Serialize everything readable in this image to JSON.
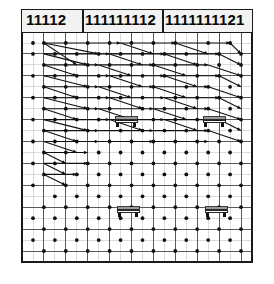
{
  "figure": {
    "background_color": "#ffffff",
    "ink_color": "#101010",
    "grid_line_color": "#b8b8b8",
    "major_grid_color": "#4a4a4a",
    "border_color": "#1a1a1a",
    "frame": {
      "x": 22,
      "y": 10,
      "width": 230,
      "height": 252
    }
  },
  "header": {
    "row_height": 22,
    "groups": [
      {
        "id": "group-1",
        "label": "11112",
        "x": 24,
        "width": 59
      },
      {
        "id": "group-2",
        "label": "111111112",
        "x": 83,
        "width": 80
      },
      {
        "id": "group-3",
        "label": "1111111121",
        "x": 163,
        "width": 89
      }
    ],
    "separator_x": [
      83,
      163
    ]
  },
  "grid": {
    "minor_step_x": 11.5,
    "minor_step_y": 11.5,
    "major_step_x": 23,
    "major_step_y": 23,
    "columns": 20,
    "rows": 20
  },
  "markers": {
    "bench_label": "bench-marker",
    "bench_count": 4,
    "benches": [
      {
        "id": "bench-1",
        "x": 126,
        "y": 120
      },
      {
        "id": "bench-2",
        "x": 214,
        "y": 120
      },
      {
        "id": "bench-3",
        "x": 128,
        "y": 210
      },
      {
        "id": "bench-4",
        "x": 216,
        "y": 210
      }
    ]
  },
  "chart_data": {
    "type": "scatter",
    "title": "11112 111111112 1111111121",
    "xlabel": "",
    "ylabel": "",
    "grid": true,
    "legend": "none",
    "xlim": [
      0,
      20
    ],
    "ylim": [
      0,
      20
    ],
    "nodes": [
      [
        1,
        1
      ],
      [
        2,
        1
      ],
      [
        4,
        1
      ],
      [
        6,
        1
      ],
      [
        8,
        1
      ],
      [
        10,
        1
      ],
      [
        12,
        1
      ],
      [
        14,
        1
      ],
      [
        17,
        1
      ],
      [
        19,
        1
      ],
      [
        1,
        2
      ],
      [
        3,
        2
      ],
      [
        5,
        2
      ],
      [
        7,
        2
      ],
      [
        9,
        2
      ],
      [
        11,
        2
      ],
      [
        13,
        2
      ],
      [
        15,
        2
      ],
      [
        18,
        2
      ],
      [
        20,
        2
      ],
      [
        2,
        3
      ],
      [
        4,
        3
      ],
      [
        6,
        3
      ],
      [
        8,
        3
      ],
      [
        10,
        3
      ],
      [
        12,
        3
      ],
      [
        14,
        3
      ],
      [
        16,
        3
      ],
      [
        18,
        3
      ],
      [
        20,
        3
      ],
      [
        1,
        4
      ],
      [
        3,
        4
      ],
      [
        5,
        4
      ],
      [
        7,
        4
      ],
      [
        9,
        4
      ],
      [
        11,
        4
      ],
      [
        13,
        4
      ],
      [
        16,
        4
      ],
      [
        18,
        4
      ],
      [
        20,
        4
      ],
      [
        2,
        5
      ],
      [
        4,
        5
      ],
      [
        6,
        5
      ],
      [
        8,
        5
      ],
      [
        10,
        5
      ],
      [
        12,
        5
      ],
      [
        15,
        5
      ],
      [
        17,
        5
      ],
      [
        19,
        5
      ],
      [
        1,
        6
      ],
      [
        3,
        6
      ],
      [
        5,
        6
      ],
      [
        7,
        6
      ],
      [
        9,
        6
      ],
      [
        11,
        6
      ],
      [
        14,
        6
      ],
      [
        16,
        6
      ],
      [
        18,
        6
      ],
      [
        20,
        6
      ],
      [
        2,
        7
      ],
      [
        4,
        7
      ],
      [
        6,
        7
      ],
      [
        8,
        7
      ],
      [
        11,
        7
      ],
      [
        13,
        7
      ],
      [
        15,
        7
      ],
      [
        17,
        7
      ],
      [
        19,
        7
      ],
      [
        1,
        8
      ],
      [
        3,
        8
      ],
      [
        5,
        8
      ],
      [
        7,
        8
      ],
      [
        10,
        8
      ],
      [
        12,
        8
      ],
      [
        14,
        8
      ],
      [
        16,
        8
      ],
      [
        18,
        8
      ],
      [
        20,
        8
      ],
      [
        2,
        9
      ],
      [
        4,
        9
      ],
      [
        6,
        9
      ],
      [
        9,
        9
      ],
      [
        11,
        9
      ],
      [
        13,
        9
      ],
      [
        15,
        9
      ],
      [
        17,
        9
      ],
      [
        19,
        9
      ],
      [
        1,
        10
      ],
      [
        3,
        10
      ],
      [
        5,
        10
      ],
      [
        8,
        10
      ],
      [
        10,
        10
      ],
      [
        12,
        10
      ],
      [
        14,
        10
      ],
      [
        16,
        10
      ],
      [
        18,
        10
      ],
      [
        20,
        10
      ],
      [
        2,
        11
      ],
      [
        4,
        11
      ],
      [
        7,
        11
      ],
      [
        9,
        11
      ],
      [
        11,
        11
      ],
      [
        13,
        11
      ],
      [
        15,
        11
      ],
      [
        17,
        11
      ],
      [
        19,
        11
      ],
      [
        1,
        12
      ],
      [
        3,
        12
      ],
      [
        6,
        12
      ],
      [
        8,
        12
      ],
      [
        10,
        12
      ],
      [
        12,
        12
      ],
      [
        14,
        12
      ],
      [
        16,
        12
      ],
      [
        18,
        12
      ],
      [
        20,
        12
      ],
      [
        2,
        13
      ],
      [
        5,
        13
      ],
      [
        7,
        13
      ],
      [
        9,
        13
      ],
      [
        11,
        13
      ],
      [
        13,
        13
      ],
      [
        15,
        13
      ],
      [
        17,
        13
      ],
      [
        19,
        13
      ],
      [
        1,
        14
      ],
      [
        4,
        14
      ],
      [
        6,
        14
      ],
      [
        8,
        14
      ],
      [
        10,
        14
      ],
      [
        12,
        14
      ],
      [
        14,
        14
      ],
      [
        16,
        14
      ],
      [
        18,
        14
      ],
      [
        20,
        14
      ],
      [
        3,
        15
      ],
      [
        5,
        15
      ],
      [
        7,
        15
      ],
      [
        9,
        15
      ],
      [
        11,
        15
      ],
      [
        13,
        15
      ],
      [
        15,
        15
      ],
      [
        17,
        15
      ],
      [
        19,
        15
      ],
      [
        2,
        16
      ],
      [
        4,
        16
      ],
      [
        6,
        16
      ],
      [
        8,
        16
      ],
      [
        10,
        16
      ],
      [
        12,
        16
      ],
      [
        14,
        16
      ],
      [
        16,
        16
      ],
      [
        18,
        16
      ],
      [
        20,
        16
      ],
      [
        1,
        17
      ],
      [
        3,
        17
      ],
      [
        5,
        17
      ],
      [
        7,
        17
      ],
      [
        9,
        17
      ],
      [
        11,
        17
      ],
      [
        13,
        17
      ],
      [
        15,
        17
      ],
      [
        17,
        17
      ],
      [
        19,
        17
      ],
      [
        2,
        18
      ],
      [
        4,
        18
      ],
      [
        6,
        18
      ],
      [
        8,
        18
      ],
      [
        10,
        18
      ],
      [
        12,
        18
      ],
      [
        14,
        18
      ],
      [
        16,
        18
      ],
      [
        18,
        18
      ],
      [
        20,
        18
      ],
      [
        1,
        19
      ],
      [
        3,
        19
      ],
      [
        5,
        19
      ],
      [
        7,
        19
      ],
      [
        9,
        19
      ],
      [
        11,
        19
      ],
      [
        13,
        19
      ],
      [
        15,
        19
      ],
      [
        17,
        19
      ],
      [
        19,
        19
      ],
      [
        2,
        20
      ],
      [
        4,
        20
      ],
      [
        6,
        20
      ],
      [
        8,
        20
      ],
      [
        10,
        20
      ],
      [
        12,
        20
      ],
      [
        14,
        20
      ],
      [
        16,
        20
      ],
      [
        18,
        20
      ],
      [
        20,
        20
      ]
    ],
    "vectors": [
      [
        2,
        1,
        9,
        1
      ],
      [
        2,
        1,
        7,
        2
      ],
      [
        2,
        1,
        5,
        3
      ],
      [
        9,
        1,
        14,
        1
      ],
      [
        9,
        1,
        12,
        2
      ],
      [
        14,
        1,
        19,
        1
      ],
      [
        14,
        1,
        17,
        2
      ],
      [
        19,
        1,
        20,
        2
      ],
      [
        2,
        2,
        8,
        2
      ],
      [
        2,
        2,
        6,
        3
      ],
      [
        8,
        2,
        13,
        2
      ],
      [
        8,
        2,
        11,
        3
      ],
      [
        13,
        2,
        18,
        2
      ],
      [
        13,
        2,
        16,
        3
      ],
      [
        18,
        2,
        20,
        3
      ],
      [
        2,
        3,
        7,
        3
      ],
      [
        2,
        3,
        5,
        4
      ],
      [
        7,
        3,
        12,
        3
      ],
      [
        7,
        3,
        10,
        4
      ],
      [
        12,
        3,
        17,
        3
      ],
      [
        12,
        3,
        15,
        4
      ],
      [
        17,
        3,
        20,
        4
      ],
      [
        2,
        4,
        8,
        4
      ],
      [
        2,
        4,
        6,
        5
      ],
      [
        8,
        4,
        13,
        4
      ],
      [
        8,
        4,
        11,
        5
      ],
      [
        13,
        4,
        18,
        4
      ],
      [
        13,
        4,
        16,
        5
      ],
      [
        18,
        4,
        20,
        5
      ],
      [
        2,
        5,
        7,
        5
      ],
      [
        2,
        5,
        5,
        6
      ],
      [
        7,
        5,
        12,
        5
      ],
      [
        7,
        5,
        10,
        6
      ],
      [
        12,
        5,
        17,
        5
      ],
      [
        12,
        5,
        15,
        6
      ],
      [
        17,
        5,
        20,
        6
      ],
      [
        2,
        6,
        8,
        6
      ],
      [
        2,
        6,
        6,
        7
      ],
      [
        8,
        6,
        13,
        6
      ],
      [
        8,
        6,
        11,
        7
      ],
      [
        13,
        6,
        18,
        6
      ],
      [
        13,
        6,
        16,
        7
      ],
      [
        18,
        6,
        20,
        7
      ],
      [
        2,
        7,
        7,
        7
      ],
      [
        2,
        7,
        5,
        8
      ],
      [
        7,
        7,
        12,
        7
      ],
      [
        7,
        7,
        10,
        8
      ],
      [
        12,
        7,
        17,
        7
      ],
      [
        12,
        7,
        15,
        8
      ],
      [
        17,
        7,
        20,
        8
      ],
      [
        2,
        8,
        8,
        8
      ],
      [
        2,
        8,
        6,
        9
      ],
      [
        8,
        8,
        13,
        8
      ],
      [
        8,
        8,
        11,
        9
      ],
      [
        13,
        8,
        18,
        8
      ],
      [
        13,
        8,
        16,
        9
      ],
      [
        18,
        8,
        20,
        9
      ],
      [
        2,
        9,
        7,
        9
      ],
      [
        2,
        9,
        5,
        10
      ],
      [
        7,
        9,
        12,
        9
      ],
      [
        12,
        9,
        17,
        9
      ],
      [
        17,
        9,
        20,
        10
      ],
      [
        2,
        10,
        7,
        10
      ],
      [
        2,
        10,
        5,
        11
      ],
      [
        7,
        10,
        12,
        10
      ],
      [
        12,
        10,
        17,
        10
      ],
      [
        2,
        11,
        6,
        11
      ],
      [
        2,
        11,
        4,
        12
      ],
      [
        2,
        12,
        6,
        12
      ],
      [
        2,
        12,
        4,
        13
      ],
      [
        2,
        13,
        5,
        13
      ],
      [
        2,
        13,
        4,
        14
      ]
    ]
  }
}
